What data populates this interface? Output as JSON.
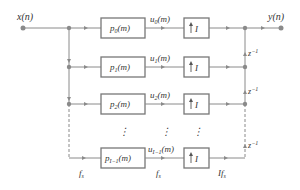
{
  "diagram": {
    "type": "polyphase-interpolator-block-diagram",
    "input_label": "x(n)",
    "output_label": "y(n)",
    "branches": [
      {
        "filter": {
          "base": "p",
          "sub": "0",
          "arg": "(m)"
        },
        "signal": {
          "base": "u",
          "sub": "0",
          "arg": "(m)"
        },
        "upsampler": "I"
      },
      {
        "filter": {
          "base": "p",
          "sub": "1",
          "arg": "(m)"
        },
        "signal": {
          "base": "u",
          "sub": "1",
          "arg": "(m)"
        },
        "upsampler": "I"
      },
      {
        "filter": {
          "base": "p",
          "sub": "2",
          "arg": "(m)"
        },
        "signal": {
          "base": "u",
          "sub": "2",
          "arg": "(m)"
        },
        "upsampler": "I"
      },
      {
        "filter": {
          "base": "p",
          "sub": "I−1",
          "arg": "(m)"
        },
        "signal": {
          "base": "u",
          "sub": "I−1",
          "arg": "(m)"
        },
        "upsampler": "I"
      }
    ],
    "delay_label": {
      "base": "z",
      "sup": "−1"
    },
    "ellipsis": "⋮",
    "rate_labels": {
      "input": "f",
      "input_sub": "s",
      "middle": "f",
      "middle_sub": "s",
      "output": "If",
      "output_sub": "s"
    },
    "colors": {
      "line": "#888888",
      "box": "#777777",
      "text": "#333333",
      "node": "#8a8a8a"
    }
  }
}
